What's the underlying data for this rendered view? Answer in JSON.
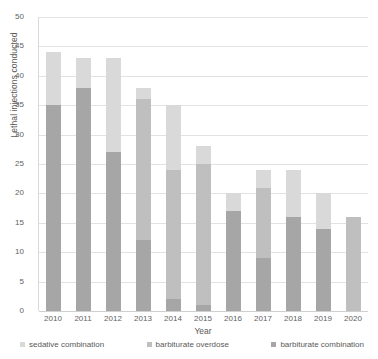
{
  "chart_data": {
    "type": "bar",
    "subtype": "stacked-bar",
    "title": "",
    "xlabel": "Year",
    "ylabel": "Lethal injections conducted",
    "ylim": [
      0,
      50
    ],
    "ytick_step": 5,
    "yticks": [
      0,
      5,
      10,
      15,
      20,
      25,
      30,
      35,
      40,
      45,
      50
    ],
    "grid": true,
    "legend_position": "bottom",
    "categories": [
      "2010",
      "2011",
      "2012",
      "2013",
      "2014",
      "2015",
      "2016",
      "2017",
      "2018",
      "2019",
      "2020"
    ],
    "series": [
      {
        "name": "barbiturate combination",
        "color": "#a6a6a6",
        "values": [
          35,
          38,
          27,
          12,
          2,
          1,
          17,
          9,
          16,
          14,
          0
        ]
      },
      {
        "name": "barbiturate overdose",
        "color": "#bfbfbf",
        "values": [
          0,
          0,
          0,
          24,
          22,
          24,
          0,
          12,
          0,
          0,
          16
        ]
      },
      {
        "name": "sedative combination",
        "color": "#d9d9d9",
        "values": [
          9,
          5,
          16,
          2,
          11,
          3,
          3,
          3,
          8,
          6,
          0
        ]
      }
    ],
    "totals": [
      44,
      43,
      43,
      38,
      35,
      28,
      20,
      24,
      24,
      20,
      16
    ],
    "annotations": []
  },
  "legend": {
    "items": [
      {
        "label": "sedative combination",
        "swatch_name": "legend-swatch-sedative-combination"
      },
      {
        "label": "barbiturate overdose",
        "swatch_name": "legend-swatch-barbiturate-overdose"
      },
      {
        "label": "barbiturate combination",
        "swatch_name": "legend-swatch-barbiturate-combination"
      }
    ]
  },
  "colors": {
    "sedative_combination": "#d9d9d9",
    "barbiturate_overdose": "#bfbfbf",
    "barbiturate_combination": "#a6a6a6",
    "gridline": "#e2e2e2",
    "axis": "#d9d9d9",
    "text": "#595959"
  }
}
